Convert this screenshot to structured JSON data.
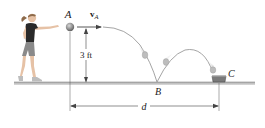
{
  "figure": {
    "labels": {
      "point_a": "A",
      "velocity_symbol": "v",
      "velocity_subscript": "A",
      "height": "3 ft",
      "point_b": "B",
      "point_c": "C",
      "distance": "d"
    },
    "colors": {
      "ground": "#b9b9b9",
      "ground_edge": "#7a7a7a",
      "trajectory": "#9a9a9a",
      "ball": "#8c8c8c",
      "ball_ghost": "#c2c2c2",
      "container": "#6e6e6e",
      "dimension": "#444444",
      "shirt": "#2a2a2a",
      "shorts": "#8a8a8a",
      "skin": "#e6c2a6",
      "hair": "#8d6a4a"
    }
  }
}
